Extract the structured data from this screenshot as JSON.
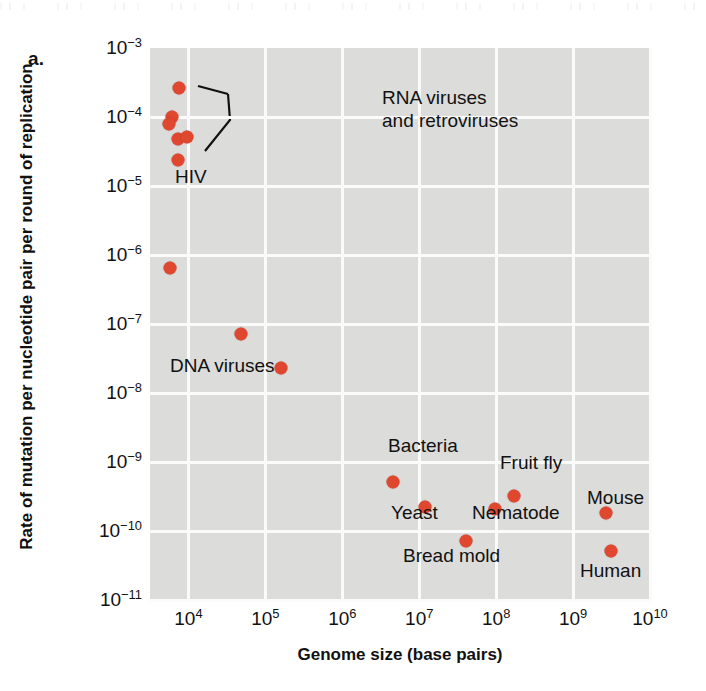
{
  "figure": {
    "panel_label": "a.",
    "dot_color": "#e0472f",
    "plot_background": "#dcdcda",
    "gridline_color": "#fbfbfb"
  },
  "chart_data": {
    "type": "scatter",
    "title": "",
    "xlabel": "Genome size (base pairs)",
    "ylabel": "Rate of mutation per nucleotide pair per round of replication",
    "xscale": "log",
    "yscale": "log",
    "xlim": [
      3160,
      10000000000
    ],
    "ylim": [
      1e-11,
      0.001
    ],
    "grid": true,
    "legend": "none",
    "xticks": [
      "10⁴",
      "10⁵",
      "10⁶",
      "10⁷",
      "10⁸",
      "10⁹",
      "10¹⁰"
    ],
    "xtick_values": [
      10000,
      100000,
      1000000,
      10000000,
      100000000,
      1000000000,
      10000000000
    ],
    "yticks": [
      "10⁻³",
      "10⁻⁴",
      "10⁻⁵",
      "10⁻⁶",
      "10⁻⁷",
      "10⁻⁸",
      "10⁻⁹",
      "10⁻¹⁰",
      "10⁻¹¹"
    ],
    "ytick_values": [
      0.001,
      0.0001,
      1e-05,
      1e-06,
      1e-07,
      1e-08,
      1e-09,
      1e-10,
      1e-11
    ],
    "points": [
      {
        "name": "RNA virus 1",
        "x": 7600,
        "y": 0.00026
      },
      {
        "name": "RNA virus 2",
        "x": 6100,
        "y": 0.0001
      },
      {
        "name": "RNA virus 3",
        "x": 5600,
        "y": 8e-05
      },
      {
        "name": "RNA virus 4",
        "x": 7300,
        "y": 4.8e-05
      },
      {
        "name": "retrovirus",
        "x": 9700,
        "y": 5.2e-05
      },
      {
        "name": "HIV",
        "x": 7400,
        "y": 2.4e-05
      },
      {
        "name": "DNA virus 1",
        "x": 5800,
        "y": 6.5e-07
      },
      {
        "name": "DNA virus 2",
        "x": 48000,
        "y": 7.2e-08
      },
      {
        "name": "DNA virus 3",
        "x": 160000,
        "y": 2.3e-08
      },
      {
        "name": "Bacteria",
        "x": 4600000,
        "y": 5.2e-10
      },
      {
        "name": "Yeast",
        "x": 12000000,
        "y": 2.2e-10
      },
      {
        "name": "Bread mold",
        "x": 40000000,
        "y": 7.2e-11
      },
      {
        "name": "Nematode",
        "x": 97000000,
        "y": 2.1e-10
      },
      {
        "name": "Fruit fly",
        "x": 170000000,
        "y": 3.2e-10
      },
      {
        "name": "Mouse",
        "x": 2700000000,
        "y": 1.8e-10
      },
      {
        "name": "Human",
        "x": 3100000000,
        "y": 5.2e-11
      }
    ],
    "annotations": [
      {
        "name": "rna-viruses",
        "text": "RNA viruses\nand retroviruses",
        "x_px": 232,
        "y_px": 38
      },
      {
        "name": "hiv",
        "text": "HIV",
        "x_px": 25,
        "y_px": 117
      },
      {
        "name": "dna-viruses",
        "text": "DNA viruses",
        "x_px": 20,
        "y_px": 306
      },
      {
        "name": "bacteria",
        "text": "Bacteria",
        "x_px": 238,
        "y_px": 386
      },
      {
        "name": "yeast",
        "text": "Yeast",
        "x_px": 241,
        "y_px": 453
      },
      {
        "name": "bread-mold",
        "text": "Bread mold",
        "x_px": 253,
        "y_px": 496
      },
      {
        "name": "nematode",
        "text": "Nematode",
        "x_px": 322,
        "y_px": 453
      },
      {
        "name": "fruit-fly",
        "text": "Fruit fly",
        "x_px": 350,
        "y_px": 403
      },
      {
        "name": "mouse",
        "text": "Mouse",
        "x_px": 437,
        "y_px": 438
      },
      {
        "name": "human",
        "text": "Human",
        "x_px": 430,
        "y_px": 511
      }
    ]
  }
}
